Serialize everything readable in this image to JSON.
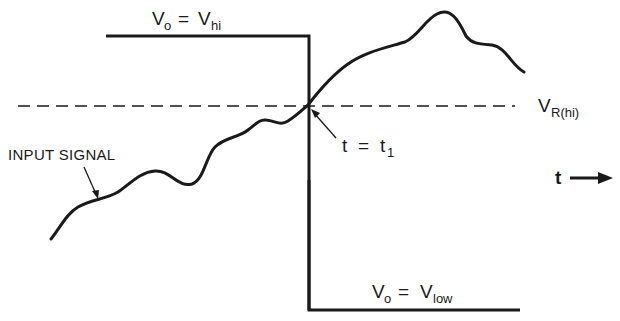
{
  "diagram": {
    "colors": {
      "ink": "#1a1a1a",
      "background": "#ffffff"
    },
    "labels": {
      "vo_hi": {
        "main": "V",
        "sub_o": "o",
        "eq": "=",
        "v": "V",
        "sub": "hi"
      },
      "vo_low": {
        "main": "V",
        "sub_o": "o",
        "eq": "=",
        "v": "V",
        "sub": "low"
      },
      "vr_hi": {
        "main": "V",
        "sub": "R(hi)"
      },
      "t_equals": {
        "t": "t",
        "eq": "=",
        "t1": "t",
        "sub": "1"
      },
      "input_signal": "INPUT SIGNAL",
      "time_axis": "t"
    },
    "elements": {
      "output_high_level": "Output high level line (Vo = Vhi) until t = t1",
      "output_low_level": "Output low level line (Vo = Vlow) after t = t1",
      "threshold_line": "Dashed reference threshold VR(hi)",
      "input_signal_curve": "Wavy rising input signal crossing threshold at t1",
      "time_arrow": "Time axis arrow"
    }
  }
}
